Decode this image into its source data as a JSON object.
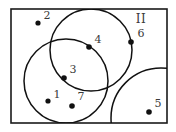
{
  "figure": {
    "background_color": "#ffffff",
    "stroke_color": "#111111",
    "label_color": "#3a3a3a",
    "frame": {
      "x": 11,
      "y": 9,
      "width": 156,
      "height": 114
    },
    "region_labels": [
      {
        "id": "region-II",
        "text": "II",
        "x": 141,
        "y": 19
      }
    ],
    "circles": [
      {
        "id": "circle-top",
        "cx": 91,
        "cy": 50,
        "r": 41
      },
      {
        "id": "circle-left",
        "cx": 66,
        "cy": 81,
        "r": 42
      },
      {
        "id": "circle-bottom-right",
        "cx": 161,
        "cy": 118,
        "r": 50
      }
    ],
    "points": [
      {
        "id": "point-2",
        "label": "2",
        "cx": 38,
        "cy": 23,
        "r": 2.6,
        "label_x": 47,
        "label_y": 16
      },
      {
        "id": "point-4",
        "label": "4",
        "cx": 89,
        "cy": 47,
        "r": 2.8,
        "label_x": 98,
        "label_y": 40
      },
      {
        "id": "point-6",
        "label": "6",
        "cx": 131,
        "cy": 42,
        "r": 2.8,
        "label_x": 141,
        "label_y": 34
      },
      {
        "id": "point-3",
        "label": "3",
        "cx": 64,
        "cy": 78,
        "r": 2.8,
        "label_x": 73,
        "label_y": 70
      },
      {
        "id": "point-1",
        "label": "1",
        "cx": 48,
        "cy": 101,
        "r": 2.6,
        "label_x": 57,
        "label_y": 95
      },
      {
        "id": "point-7",
        "label": "7",
        "cx": 72,
        "cy": 106,
        "r": 2.8,
        "label_x": 81,
        "label_y": 97
      },
      {
        "id": "point-5",
        "label": "5",
        "cx": 149,
        "cy": 112,
        "r": 2.8,
        "label_x": 158,
        "label_y": 104
      }
    ]
  }
}
